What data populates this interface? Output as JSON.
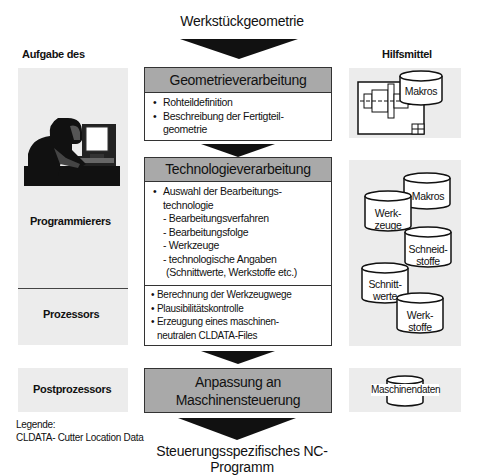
{
  "header": {
    "title": "Werkstückgeometrie"
  },
  "footer": {
    "title": "Steuerungsspezifisches NC-Programm"
  },
  "left_column": {
    "heading": "Aufgabe des",
    "roles": [
      "Programmierers",
      "Prozessors",
      "Postprozessors"
    ],
    "illustration": "programmer-at-computer"
  },
  "right_column": {
    "heading": "Hilfsmittel",
    "geometry_tools": {
      "cylinder": "Makros",
      "drawing": "technical-drawing-icon"
    },
    "technology_tools": [
      "Makros",
      "Werk-\nzeuge",
      "Schneid-\nstoffe",
      "Schnitt-\nwerte",
      "Werk-\nstoffe"
    ],
    "postprocessor_tools": "Maschinendaten"
  },
  "stages": {
    "geometry": {
      "title": "Geometrieverarbeitung",
      "items": [
        "Rohteildefinition",
        "Beschreibung der Fertigteil-",
        "geometrie"
      ]
    },
    "technology": {
      "title": "Technologieverarbeitung",
      "items": [
        "Auswahl der Bearbeitungs-",
        "technologie"
      ],
      "subitems": [
        "- Bearbeitungsverfahren",
        "- Bearbeitungsfolge",
        "- Werkzeuge",
        "- technologische Angaben",
        "(Schnittwerte, Werkstoffe etc.)"
      ],
      "processor_items": [
        "Berechnung der Werkzeugwege",
        "Plausibilitätskontrolle",
        "Erzeugung eines maschinen-",
        "neutralen CLDATA-Files"
      ]
    },
    "postprocessing": {
      "title_line1": "Anpassung an",
      "title_line2": "Maschinensteuerung"
    }
  },
  "legend": {
    "heading": "Legende:",
    "entry": "CLDATA- Cutter Location Data"
  },
  "colors": {
    "header_fill": "#a9a9a9",
    "panel_fill": "#ececec",
    "arrow": "#111111",
    "border": "#333333"
  }
}
